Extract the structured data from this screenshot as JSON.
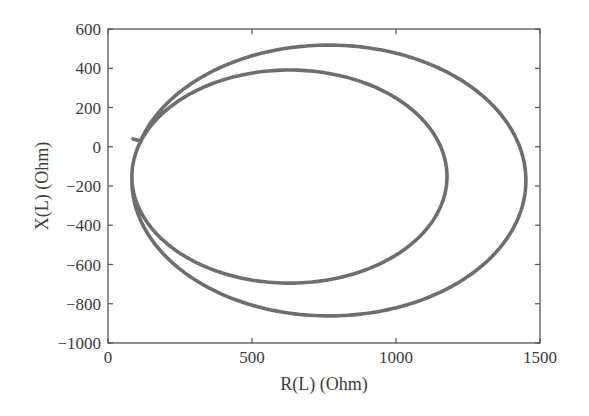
{
  "chart_data": {
    "type": "line",
    "title": "",
    "xlabel": "R(L) (Ohm)",
    "ylabel": "X(L) (Ohm)",
    "xlim": [
      0,
      1500
    ],
    "ylim": [
      -1000,
      600
    ],
    "x_ticks": [
      0,
      500,
      1000,
      1500
    ],
    "y_ticks": [
      600,
      400,
      200,
      0,
      -200,
      -400,
      -600,
      -800,
      -1000
    ],
    "x_tick_labels": [
      "0",
      "500",
      "1000",
      "1500"
    ],
    "y_tick_labels": [
      "600",
      "400",
      "200",
      "0",
      "−200",
      "−400",
      "−600",
      "−800",
      "−1000"
    ],
    "grid": false,
    "legend": null,
    "line_color": "#6e6e6e",
    "axis_color": "#555555",
    "segments": [
      {
        "name": "outer loop",
        "center": [
          767,
          -172
        ],
        "semi_axes": [
          684,
          690
        ],
        "theta_start_deg": 163,
        "theta_end_deg": -180
      },
      {
        "name": "inner loop",
        "center": [
          630,
          -152
        ],
        "semi_axes": [
          547,
          543
        ],
        "theta_start_deg": 180,
        "theta_end_deg": -180
      }
    ],
    "series": [
      {
        "name": "Z(L) trajectory",
        "x": [
          87,
          175,
          283,
          425,
          590,
          767,
          944,
          1109,
          1251,
          1359,
          1428,
          1451,
          1428,
          1359,
          1251,
          1109,
          944,
          767,
          590,
          425,
          283,
          175,
          106,
          83,
          102,
          156,
          243,
          356,
          488,
          630,
          772,
          904,
          1017,
          1104,
          1158,
          1177,
          1158,
          1104,
          1017,
          904,
          772,
          630,
          488,
          356,
          243,
          156,
          102,
          83
        ],
        "y": [
          40,
          173,
          316,
          426,
          494,
          518,
          494,
          426,
          316,
          173,
          7,
          -172,
          -351,
          -517,
          -660,
          -770,
          -838,
          -862,
          -838,
          -770,
          -660,
          -517,
          -351,
          -172,
          -11,
          120,
          232,
          318,
          373,
          391,
          373,
          318,
          232,
          120,
          -11,
          -152,
          -293,
          -424,
          -536,
          -622,
          -677,
          -694,
          -677,
          -622,
          -536,
          -424,
          -293,
          -152
        ]
      }
    ]
  }
}
